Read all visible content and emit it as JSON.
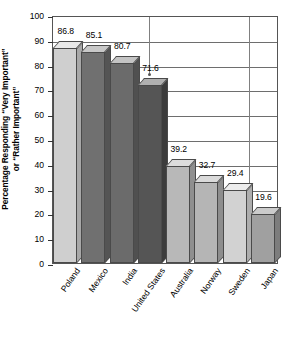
{
  "chart_data": {
    "type": "bar",
    "title": "",
    "xlabel": "",
    "ylabel": "Percentage Responding \"Very Important\" or \"Rather Important\"",
    "ylabel_lines": [
      "Percentage Responding “Very Important”",
      "or “Rather Important”"
    ],
    "categories": [
      "Poland",
      "Mexico",
      "India",
      "United States",
      "Australia",
      "Norway",
      "Sweden",
      "Japan"
    ],
    "values": [
      86.8,
      85.1,
      80.7,
      71.6,
      39.2,
      32.7,
      29.4,
      19.6
    ],
    "value_labels": [
      "86.8",
      "85.1",
      "80.7",
      "71.6",
      "39.2",
      "32.7",
      "29.4",
      "19.6"
    ],
    "ylim": [
      0,
      100
    ],
    "ytick_step": 10,
    "yticks": [
      0,
      10,
      20,
      30,
      40,
      50,
      60,
      70,
      80,
      90,
      100
    ],
    "ytick_labels": [
      "0",
      "10",
      "20",
      "30",
      "40",
      "50",
      "60",
      "70",
      "80",
      "90",
      "100"
    ],
    "grid": true,
    "grid_axis": "y",
    "legend": "none",
    "bar_style": "3d",
    "bar_colors": [
      "#cfcfcf",
      "#707070",
      "#6b6b6b",
      "#555555",
      "#b8b8b8",
      "#b5b5b5",
      "#d2d2d2",
      "#a0a0a0"
    ],
    "bar_top_colors": [
      "#e8e8e8",
      "#c8c8c8",
      "#c4c4c4",
      "#b0b0b0",
      "#dcdcdc",
      "#dadada",
      "#ececec",
      "#cbcbcb"
    ],
    "bar_side_colors": [
      "#a8a8a8",
      "#545454",
      "#505050",
      "#3c3c3c",
      "#8f8f8f",
      "#8d8d8d",
      "#adadad",
      "#7d7d7d"
    ],
    "annotations": [
      {
        "name": "leader-line-united-states",
        "x_pct": 42.5,
        "y_value": 77.0
      },
      {
        "name": "leader-line-sweden",
        "x_pct": 86.7,
        "y_value": 29.8
      }
    ]
  }
}
